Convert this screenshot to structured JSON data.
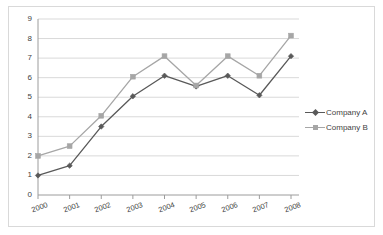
{
  "chart_data": {
    "type": "line",
    "title": "",
    "subtitle": "",
    "xlabel": "",
    "ylabel": "",
    "categories": [
      "2000",
      "2001",
      "2002",
      "2003",
      "2004",
      "2005",
      "2006",
      "2007",
      "2008"
    ],
    "series": [
      {
        "name": "Company A",
        "values": [
          1.0,
          1.5,
          3.5,
          5.05,
          6.1,
          5.55,
          6.1,
          5.1,
          7.1
        ],
        "color": "#595959",
        "marker": "diamond"
      },
      {
        "name": "Company B",
        "values": [
          2.0,
          2.5,
          4.05,
          6.05,
          7.1,
          5.6,
          7.1,
          6.1,
          8.15
        ],
        "color": "#a6a6a6",
        "marker": "square"
      }
    ],
    "ylim": [
      0,
      9
    ],
    "yticks": [
      "0",
      "1",
      "2",
      "3",
      "4",
      "5",
      "6",
      "7",
      "8",
      "9"
    ],
    "grid": "horizontal",
    "gridline_color": "#d9d9d9",
    "axis_color": "#9c9c9c",
    "legend_position": "right",
    "xtick_rotation": -20,
    "frame_color": "#d9d9d9",
    "background": "#ffffff"
  }
}
